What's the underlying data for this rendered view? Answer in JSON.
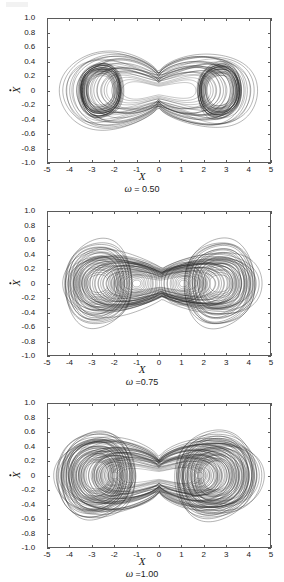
{
  "figure": {
    "title": "",
    "panel_count": 3
  },
  "axes": {
    "x_title": "X",
    "y_title": "X",
    "y_title_note": "X with overdot (velocity)",
    "x_ticks": [
      "-5",
      "-4",
      "-3",
      "-2",
      "-1",
      "0",
      "1",
      "2",
      "3",
      "4",
      "5"
    ],
    "y_ticks": [
      "1.0",
      "0.8",
      "0.6",
      "0.4",
      "0.2",
      "0",
      "-0.2",
      "-0.4",
      "-0.6",
      "-0.8",
      "-1.0"
    ],
    "xlim": [
      -5,
      5
    ],
    "ylim": [
      -1.0,
      1.0
    ],
    "frame_color": "#5a5a5a",
    "curve_color": "#2b2b2b"
  },
  "panels": [
    {
      "id": "panel-omega-050",
      "caption_symbol": "ω",
      "caption_text": " = 0.50",
      "caption_full": "ω = 0.50",
      "omega": 0.5
    },
    {
      "id": "panel-omega-075",
      "caption_symbol": "ω",
      "caption_text": " =0.75",
      "caption_full": "ω =0.75",
      "omega": 0.75
    },
    {
      "id": "panel-omega-100",
      "caption_symbol": "ω",
      "caption_text": " =1.00",
      "caption_full": "ω =1.00",
      "omega": 1.0
    }
  ],
  "chart_data": {
    "type": "line",
    "subtype": "phase-portrait",
    "title": "",
    "xlabel": "X",
    "ylabel": "Ẋ",
    "xlim": [
      -5,
      5
    ],
    "ylim": [
      -1.0,
      1.0
    ],
    "xticks": [
      -5,
      -4,
      -3,
      -2,
      -1,
      0,
      1,
      2,
      3,
      4,
      5
    ],
    "yticks": [
      1.0,
      0.8,
      0.6,
      0.4,
      0.2,
      0,
      -0.2,
      -0.4,
      -0.6,
      -0.8,
      -1.0
    ],
    "grid": false,
    "legend": null,
    "panels": [
      {
        "name": "ω = 0.50",
        "annotation": "ω = 0.50",
        "description": "Double-well chaotic attractor: two dense orbit bundles centred near x=-2.6 and x=+2.7, thick tori of radius ~0.4 in xdot, plus sparse large excursions reaching x=±4.4 and xdot=±0.85, with a narrow crossing waist near x=0.",
        "lobe_centers": [
          [
            -2.6,
            0.0
          ],
          [
            2.7,
            0.0
          ]
        ],
        "inner_loop_rx": [
          0.55,
          0.55
        ],
        "inner_loop_ry": [
          0.22,
          0.22
        ],
        "core_loop_rx": [
          1.0,
          1.0
        ],
        "core_loop_ry": [
          0.4,
          0.4
        ],
        "x_extent": [
          -4.45,
          4.4
        ],
        "y_extent": [
          -0.87,
          0.85
        ],
        "waist_x": 0.0,
        "waist_halfwidth": 0.12,
        "n_orbits": 34,
        "density": "dense inner tori, sparse outer excursions"
      },
      {
        "name": "ω =0.75",
        "annotation": "ω =0.75",
        "description": "Lemniscate (figure-eight) chaotic attractor: broad outer envelope x from -4.3 to +4.6, xdot from -0.70 to +0.70, with many nested concentric loops centred near x=-2.7 and x=+2.7 and additional secondary small loops near x=-1.0 and x=+1.1; trajectories cross at x≈0.",
        "lobe_centers": [
          [
            -2.7,
            0.0
          ],
          [
            2.7,
            0.0
          ]
        ],
        "secondary_centers": [
          [
            -1.0,
            0.0
          ],
          [
            1.1,
            0.0
          ]
        ],
        "inner_loop_rx": [
          0.45,
          0.45
        ],
        "inner_loop_ry": [
          0.13,
          0.13
        ],
        "core_loop_rx": [
          1.5,
          1.6
        ],
        "core_loop_ry": [
          0.62,
          0.62
        ],
        "x_extent": [
          -4.3,
          4.6
        ],
        "y_extent": [
          -0.7,
          0.7
        ],
        "waist_x": 0.05,
        "waist_halfwidth": 0.18,
        "n_orbits": 40,
        "density": "uniform nested concentric loops"
      },
      {
        "name": "ω =1.00",
        "annotation": "ω =1.00",
        "description": "Wide double-scroll chaotic attractor filling most of the frame: outer envelope x from -4.7 to +4.7, xdot from -0.82 to +0.80, with many interleaved concentric loops around x=-2.8 and x=+2.5, secondary loop families near x=-2.0 and x=+1.8, and a dense crossing region at x≈0.",
        "lobe_centers": [
          [
            -2.8,
            0.0
          ],
          [
            2.5,
            0.0
          ]
        ],
        "secondary_centers": [
          [
            -2.0,
            0.0
          ],
          [
            1.8,
            0.0
          ]
        ],
        "inner_loop_rx": [
          0.55,
          0.55
        ],
        "inner_loop_ry": [
          0.2,
          0.2
        ],
        "core_loop_rx": [
          1.7,
          1.8
        ],
        "core_loop_ry": [
          0.63,
          0.63
        ],
        "x_extent": [
          -4.7,
          4.7
        ],
        "y_extent": [
          -0.82,
          0.8
        ],
        "waist_x": 0.0,
        "waist_halfwidth": 0.25,
        "n_orbits": 48,
        "density": "very dense, heavily overlapping"
      }
    ]
  }
}
